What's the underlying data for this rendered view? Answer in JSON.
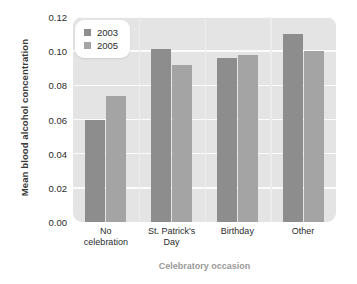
{
  "chart_data": {
    "type": "bar",
    "title": "",
    "xlabel": "Celebratory occasion",
    "ylabel": "Mean blood alcohol concentration",
    "categories": [
      "No celebration",
      "St. Patrick's Day",
      "Birthday",
      "Other"
    ],
    "series": [
      {
        "name": "2003",
        "color": "#8d8d8d",
        "values": [
          0.06,
          0.101,
          0.096,
          0.11
        ]
      },
      {
        "name": "2005",
        "color": "#a4a4a4",
        "values": [
          0.074,
          0.092,
          0.098,
          0.1
        ]
      }
    ],
    "ylim": [
      0.0,
      0.12
    ],
    "yticks": [
      "0.00",
      "0.02",
      "0.04",
      "0.06",
      "0.08",
      "0.10",
      "0.12"
    ],
    "ytick_values": [
      0.0,
      0.02,
      0.04,
      0.06,
      0.08,
      0.1,
      0.12
    ],
    "grid": "horizontal",
    "legend_position": "top-left",
    "plot_background": "#e4e4e4",
    "gridline_color": "#fbfbfb"
  },
  "xtick_lines": [
    [
      "No",
      "celebration"
    ],
    [
      "St. Patrick's",
      "Day"
    ],
    [
      "Birthday",
      ""
    ],
    [
      "Other",
      ""
    ]
  ]
}
